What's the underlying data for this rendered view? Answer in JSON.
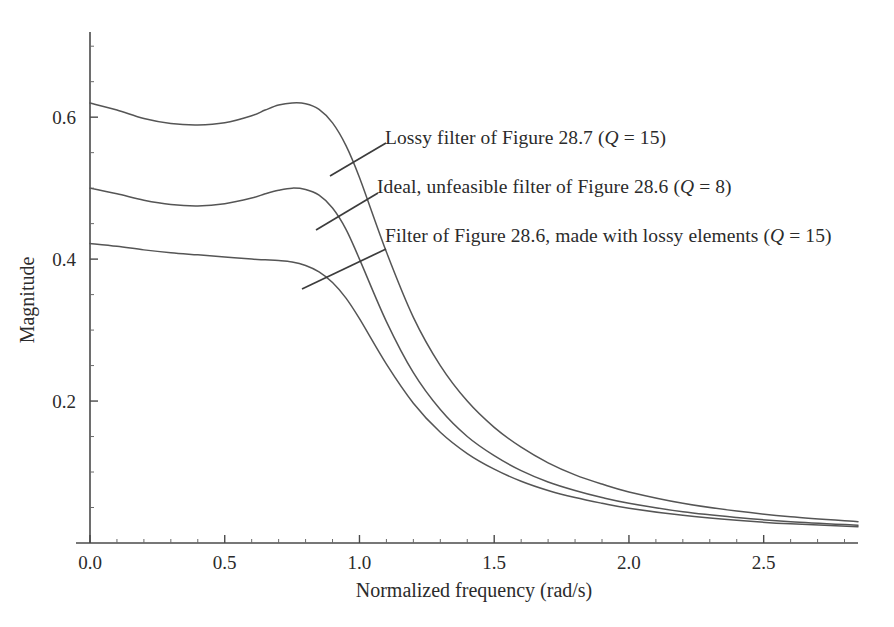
{
  "chart_data": {
    "type": "line",
    "title": "",
    "xlabel": "Normalized frequency (rad/s)",
    "ylabel": "Magnitude",
    "xlim": [
      0.0,
      2.85
    ],
    "ylim": [
      0.0,
      0.72
    ],
    "xticks": [
      "0.0",
      "0.5",
      "1.0",
      "1.5",
      "2.0",
      "2.5"
    ],
    "xtick_values": [
      0.0,
      0.5,
      1.0,
      1.5,
      2.0,
      2.5
    ],
    "yticks": [
      "0.2",
      "0.4",
      "0.6"
    ],
    "ytick_values": [
      0.2,
      0.4,
      0.6
    ],
    "grid": false,
    "legend_position": "inline-annotations",
    "x": [
      0.0,
      0.1,
      0.2,
      0.3,
      0.4,
      0.5,
      0.6,
      0.65,
      0.7,
      0.75,
      0.8,
      0.85,
      0.9,
      0.95,
      1.0,
      1.1,
      1.2,
      1.3,
      1.4,
      1.5,
      1.6,
      1.7,
      1.8,
      1.9,
      2.0,
      2.2,
      2.4,
      2.6,
      2.85
    ],
    "series": [
      {
        "name": "Lossy filter of Figure 28.7 (Q = 15)",
        "label_plain": "Lossy filter of Figure 28.7 (Q = 15)",
        "values": [
          0.62,
          0.61,
          0.598,
          0.591,
          0.589,
          0.592,
          0.602,
          0.61,
          0.617,
          0.62,
          0.619,
          0.611,
          0.592,
          0.56,
          0.515,
          0.41,
          0.318,
          0.25,
          0.2,
          0.163,
          0.135,
          0.113,
          0.096,
          0.083,
          0.072,
          0.056,
          0.045,
          0.037,
          0.03
        ]
      },
      {
        "name": "Ideal, unfeasible filter of Figure 28.6 (Q = 8)",
        "label_plain": "Ideal, unfeasible filter of Figure 28.6 (Q = 8)",
        "values": [
          0.5,
          0.492,
          0.483,
          0.477,
          0.475,
          0.478,
          0.486,
          0.492,
          0.497,
          0.5,
          0.498,
          0.49,
          0.472,
          0.442,
          0.4,
          0.312,
          0.24,
          0.188,
          0.15,
          0.123,
          0.102,
          0.086,
          0.074,
          0.064,
          0.056,
          0.044,
          0.036,
          0.03,
          0.025
        ]
      },
      {
        "name": "Filter of Figure 28.6, made with lossy elements (Q = 15)",
        "label_plain": "Filter of Figure 28.6, made with lossy elements (Q = 15)",
        "values": [
          0.422,
          0.418,
          0.413,
          0.409,
          0.406,
          0.403,
          0.4,
          0.399,
          0.398,
          0.396,
          0.391,
          0.382,
          0.367,
          0.345,
          0.316,
          0.252,
          0.197,
          0.156,
          0.126,
          0.104,
          0.087,
          0.074,
          0.064,
          0.056,
          0.049,
          0.039,
          0.032,
          0.027,
          0.023
        ]
      }
    ]
  },
  "annotations": [
    {
      "id": "annot-lossy-287",
      "text_before": "Lossy filter of Figure 28.7 (",
      "q": "Q",
      "text_after": " = 15)"
    },
    {
      "id": "annot-ideal-286",
      "text_before": "Ideal, unfeasible filter of Figure 28.6 (",
      "q": "Q",
      "text_after": " = 8)"
    },
    {
      "id": "annot-lossy-286",
      "text_before": "Filter of Figure 28.6, made with lossy elements (",
      "q": "Q",
      "text_after": " = 15)"
    }
  ],
  "colors": {
    "curve": "#555555",
    "axis": "#4a4a4a",
    "text": "#2b2b2b",
    "background": "#ffffff"
  }
}
